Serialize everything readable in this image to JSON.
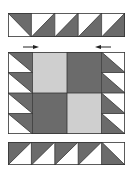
{
  "diagram": {
    "colors": {
      "background": "#ffffff",
      "dark": "#6b6b6b",
      "light": "#cfcfcf",
      "white": "#ffffff",
      "outline": "#333333"
    },
    "top_strip": {
      "units": [
        {
          "type": "half-square-triangle",
          "dark": "top-right"
        },
        {
          "type": "half-square-triangle",
          "dark": "bottom-right"
        },
        {
          "type": "half-square-triangle",
          "dark": "bottom-right"
        },
        {
          "type": "half-square-triangle",
          "dark": "bottom-right"
        },
        {
          "type": "half-square-triangle",
          "dark": "bottom-right"
        }
      ]
    },
    "arrows": [
      {
        "name": "press-right-arrow",
        "direction": "right"
      },
      {
        "name": "press-left-arrow",
        "direction": "left"
      }
    ],
    "middle_section": {
      "left_column": [
        {
          "type": "half-square-triangle",
          "dark": "top-right"
        },
        {
          "type": "half-square-triangle",
          "dark": "top-right"
        },
        {
          "type": "half-square-triangle",
          "dark": "top-right"
        },
        {
          "type": "half-square-triangle",
          "dark": "top-right"
        }
      ],
      "center_four_patch": [
        {
          "position": "top-left",
          "fill": "light"
        },
        {
          "position": "top-right",
          "fill": "dark"
        },
        {
          "position": "bottom-left",
          "fill": "dark"
        },
        {
          "position": "bottom-right",
          "fill": "light"
        }
      ],
      "right_column": [
        {
          "type": "half-square-triangle",
          "dark": "bottom-left"
        },
        {
          "type": "half-square-triangle",
          "dark": "bottom-left"
        },
        {
          "type": "half-square-triangle",
          "dark": "bottom-left"
        },
        {
          "type": "half-square-triangle",
          "dark": "bottom-left"
        }
      ]
    },
    "bottom_strip": {
      "units": [
        {
          "type": "half-square-triangle",
          "dark": "top-left"
        },
        {
          "type": "half-square-triangle",
          "dark": "top-left"
        },
        {
          "type": "half-square-triangle",
          "dark": "top-left"
        },
        {
          "type": "half-square-triangle",
          "dark": "top-left"
        },
        {
          "type": "half-square-triangle",
          "dark": "bottom-left"
        }
      ]
    }
  }
}
